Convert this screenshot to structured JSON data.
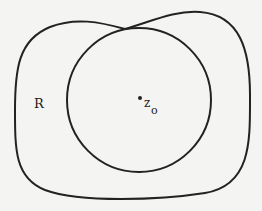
{
  "diagram": {
    "region_label": "R",
    "center_label": "z",
    "center_subscript": "o",
    "stroke_color": "#222222",
    "background_color": "#f4f4f2"
  }
}
